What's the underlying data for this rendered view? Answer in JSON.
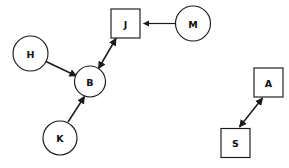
{
  "diagram": {
    "background_color": "#ffffff",
    "stroke_color": "#1a1a1a",
    "node_fill_color": "#ffffff",
    "label_color": "#111111",
    "nodes": [
      {
        "id": "H",
        "label": "H",
        "shape": "circle",
        "cx": 30.5,
        "cy": 53.5,
        "r": 17.5
      },
      {
        "id": "B",
        "label": "B",
        "shape": "circle",
        "cx": 90.0,
        "cy": 81.5,
        "r": 15.5
      },
      {
        "id": "K",
        "label": "K",
        "shape": "circle",
        "cx": 60.0,
        "cy": 138.0,
        "r": 17.0
      },
      {
        "id": "J",
        "label": "J",
        "shape": "square",
        "cx": 125.5,
        "cy": 23.5,
        "size": 29
      },
      {
        "id": "M",
        "label": "M",
        "shape": "circle",
        "cx": 193.0,
        "cy": 23.5,
        "r": 17.5
      },
      {
        "id": "A",
        "label": "A",
        "shape": "square",
        "cx": 268.5,
        "cy": 82.5,
        "size": 29
      },
      {
        "id": "S",
        "label": "S",
        "shape": "square",
        "cx": 235.5,
        "cy": 143.0,
        "size": 29
      }
    ],
    "edges": [
      {
        "id": "H-B",
        "from": "H",
        "to": "B",
        "direction": "forward",
        "x1": 46.0,
        "y1": 61.5,
        "x2": 76.5,
        "y2": 76.0
      },
      {
        "id": "K-B",
        "from": "K",
        "to": "B",
        "direction": "forward",
        "x1": 68.0,
        "y1": 122.0,
        "x2": 84.5,
        "y2": 96.5
      },
      {
        "id": "J-B",
        "from": "J",
        "to": "B",
        "direction": "both",
        "x1": 116.0,
        "y1": 38.5,
        "x2": 98.5,
        "y2": 68.5
      },
      {
        "id": "M-J",
        "from": "M",
        "to": "J",
        "direction": "forward",
        "x1": 175.0,
        "y1": 23.5,
        "x2": 141.5,
        "y2": 23.5
      },
      {
        "id": "S-A",
        "from": "S",
        "to": "A",
        "direction": "both",
        "x1": 239.5,
        "y1": 127.0,
        "x2": 262.5,
        "y2": 98.0
      }
    ]
  }
}
